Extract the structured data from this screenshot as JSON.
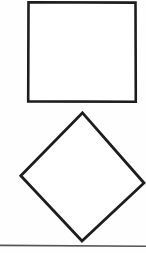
{
  "page": {
    "width": 146,
    "height": 253,
    "background_color": "#fefefe",
    "document_type": "scanned-geometry-figure"
  },
  "palette": {
    "stroke_dark": "#1d1d1f",
    "stroke_mid": "#3a3a3c",
    "rule_gray": "#55555a",
    "paper_white": "#fefefe",
    "shape_fill": "#ffffff"
  },
  "figure": {
    "name": "square-and-diamond-figure",
    "shape_count": 2,
    "has_labels": false,
    "has_axes": false,
    "has_text": false,
    "shapes": [
      {
        "id": "square-upright",
        "name": "upright-square",
        "type": "square",
        "fill": "#ffffff",
        "stroke": "#1d1d1f",
        "stroke_width": 2.6,
        "rotation_deg": 0,
        "points": "28.5,2.2 135.5,2.6 135.8,101.8 28.2,101.4",
        "bbox": {
          "x": 28,
          "y": 2,
          "width": 108,
          "height": 100
        },
        "clipped_edges": [
          "top"
        ]
      },
      {
        "id": "square-rotated",
        "name": "rotated-square-diamond",
        "type": "square",
        "fill": "#ffffff",
        "stroke": "#1d1d1f",
        "stroke_width": 2.8,
        "rotation_deg": 44,
        "points": "82.5,112.8 144.0,183.0 82.0,241.0 20.8,175.8",
        "bbox": {
          "x": 21,
          "y": 113,
          "width": 123,
          "height": 128
        },
        "clipped_edges": [
          "right"
        ]
      }
    ],
    "rules": [
      {
        "id": "bottom-rule",
        "name": "horizontal-separator-rule",
        "type": "line",
        "x1": 0,
        "y1": 245.4,
        "x2": 146,
        "y2": 246.2,
        "stroke": "#55555a",
        "stroke_width": 1.6
      }
    ]
  },
  "accessibility": {
    "figure_alt": "A square above a diamond (square rotated about 45 degrees), with a horizontal rule beneath."
  }
}
